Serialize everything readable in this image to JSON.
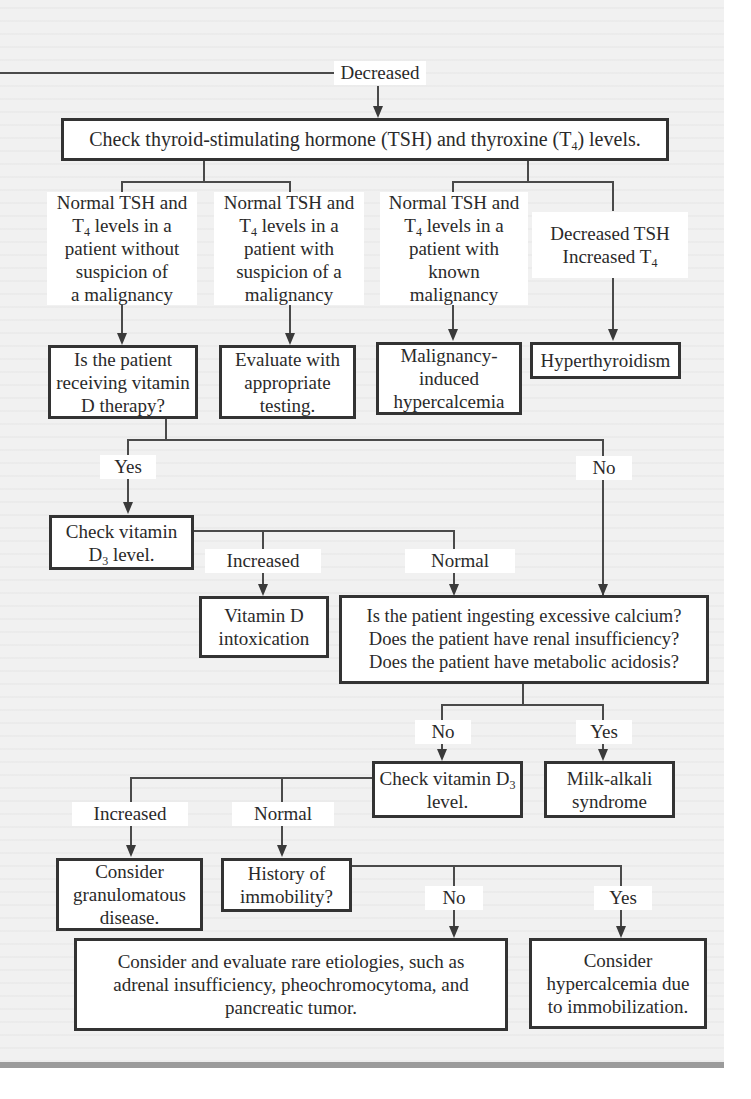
{
  "flowchart": {
    "entry_label": "Decreased",
    "check_tsh_t4": {
      "pre": "Check thyroid-stimulating hormone (TSH) and thyroxine (T",
      "sub": "4",
      "post": ") levels."
    },
    "conditions": [
      {
        "line1": "Normal TSH and",
        "t_pre": "T",
        "t_sub": "4",
        "t_post": " levels in a",
        "rest": "patient without\nsuspicion of\na malignancy"
      },
      {
        "line1": "Normal TSH and",
        "t_pre": "T",
        "t_sub": "4",
        "t_post": " levels in a",
        "rest": "patient with\nsuspicion of a\nmalignancy"
      },
      {
        "line1": "Normal TSH and",
        "t_pre": "T",
        "t_sub": "4",
        "t_post": " levels in a",
        "rest": "patient with\nknown\nmalignancy"
      },
      {
        "line1": "Decreased TSH",
        "t_pre": "Increased T",
        "t_sub": "4",
        "t_post": "",
        "rest": ""
      }
    ],
    "outcomes_row": [
      "Is the patient\nreceiving vitamin\nD therapy?",
      "Evaluate with\nappropriate\ntesting.",
      "Malignancy-\ninduced\nhypercalcemia",
      "Hyperthyroidism"
    ],
    "vitd_therapy_yes": "Yes",
    "vitd_therapy_no": "No",
    "check_vitd3_1": {
      "pre": "Check vitamin",
      "line2_pre": "D",
      "sub": "3",
      "line2_post": " level."
    },
    "vitd_increased": "Increased",
    "vitd_normal": "Normal",
    "vitd_intoxication": "Vitamin D\nintoxication",
    "questions": [
      "Is the patient ingesting excessive calcium?",
      "Does the patient have renal insufficiency?",
      "Does the patient have metabolic acidosis?"
    ],
    "questions_no": "No",
    "questions_yes": "Yes",
    "check_vitd3_2": {
      "pre": "Check vitamin D",
      "sub": "3",
      "line2": "level."
    },
    "milk_alkali": "Milk-alkali\nsyndrome",
    "vitd2_increased": "Increased",
    "vitd2_normal": "Normal",
    "granulomatous": "Consider\ngranulomatous\ndisease.",
    "immobility_q": "History of\nimmobility?",
    "immobility_no": "No",
    "immobility_yes": "Yes",
    "rare_etiologies": "Consider and evaluate rare etiologies, such as\nadrenal insufficiency, pheochromocytoma, and\npancreatic tumor.",
    "immobilization": "Consider\nhypercalcemia due\nto immobilization."
  }
}
